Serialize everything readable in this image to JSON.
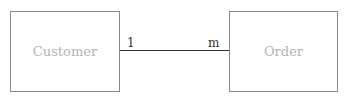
{
  "diagram": {
    "type": "er-diagram",
    "entities": [
      {
        "id": "customer",
        "label": "Customer"
      },
      {
        "id": "order",
        "label": "Order"
      }
    ],
    "relationships": [
      {
        "from": "customer",
        "to": "order",
        "from_cardinality": "1",
        "to_cardinality": "m"
      }
    ],
    "colors": {
      "entity_border": "#8a8a8a",
      "entity_text": "#b4b4b4",
      "line": "#333333",
      "cardinality_text": "#333333"
    }
  }
}
